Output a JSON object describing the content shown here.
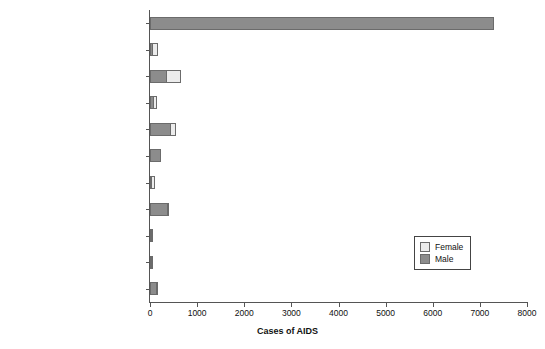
{
  "chart_data": {
    "type": "bar",
    "orientation": "horizontal",
    "stacked": true,
    "title": "",
    "xlabel": "Cases of AIDS",
    "ylabel": "",
    "xlim": [
      0,
      8000
    ],
    "xticks": [
      0,
      1000,
      2000,
      3000,
      4000,
      5000,
      6000,
      7000,
      8000
    ],
    "xtick_labels": [
      "0",
      "1000",
      "2000",
      "3000",
      "4000",
      "5000",
      "6000",
      "7000",
      "8000"
    ],
    "grid": false,
    "legend_position": "center-right",
    "categories": [
      "Sexual intercourse between men",
      "Heterosexual intercourse with\nhigh risk partner",
      "Heterosexual intercourse with\npartner from abroad",
      "Heterosexual intercourse with\npartner from UK",
      "Injecting drug use",
      "Injecting drug use or sexual\nintercourse between men",
      "Mother to infant",
      "Blood factor",
      "Blood or tissue transfer UK",
      "Blood or tissue transfer abroad",
      "Unclassified"
    ],
    "series": [
      {
        "name": "Male",
        "color": "#8c8c8c",
        "values": [
          7300,
          55,
          370,
          75,
          455,
          230,
          45,
          400,
          30,
          25,
          150
        ]
      },
      {
        "name": "Female",
        "color": "#ececec",
        "values": [
          0,
          120,
          290,
          75,
          100,
          0,
          55,
          10,
          25,
          20,
          25
        ]
      }
    ],
    "legend": [
      {
        "label": "Female",
        "color": "#ececec"
      },
      {
        "label": "Male",
        "color": "#8c8c8c"
      }
    ]
  },
  "colors": {
    "male": "#8c8c8c",
    "female": "#ececec",
    "axis": "#555555",
    "bar_outline": "#6b6b6b",
    "text": "#111111",
    "background": "#ffffff"
  }
}
